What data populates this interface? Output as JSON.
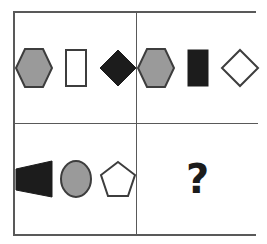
{
  "puzzle": {
    "type": "visual-analogy-matrix",
    "rows": 2,
    "columns": 2,
    "missing_cell": "bottom-right",
    "question_mark": "?",
    "colors": {
      "gray_fill": "#9a9a9a",
      "black_fill": "#1c1c1c",
      "white_fill": "#ffffff",
      "outline": "#3d3d3d",
      "frame": "#595959",
      "background": "#ffffff"
    },
    "cells": [
      {
        "position": "top-left",
        "label": "Cell A",
        "shapes": [
          {
            "shape": "hexagon",
            "fill": "gray",
            "name": "gray-hexagon"
          },
          {
            "shape": "rectangle",
            "fill": "white",
            "name": "white-rectangle"
          },
          {
            "shape": "diamond",
            "fill": "black",
            "name": "black-diamond"
          }
        ]
      },
      {
        "position": "top-right",
        "label": "Cell B",
        "shapes": [
          {
            "shape": "hexagon",
            "fill": "gray",
            "name": "gray-hexagon"
          },
          {
            "shape": "rectangle",
            "fill": "black",
            "name": "black-rectangle"
          },
          {
            "shape": "diamond",
            "fill": "white",
            "name": "white-diamond"
          }
        ]
      },
      {
        "position": "bottom-left",
        "label": "Cell C",
        "shapes": [
          {
            "shape": "trapezoid",
            "fill": "black",
            "name": "black-trapezoid"
          },
          {
            "shape": "ellipse",
            "fill": "gray",
            "name": "gray-ellipse"
          },
          {
            "shape": "pentagon",
            "fill": "white",
            "name": "white-pentagon"
          }
        ]
      },
      {
        "position": "bottom-right",
        "label": "Cell D",
        "shapes": [],
        "content": "?"
      }
    ]
  }
}
